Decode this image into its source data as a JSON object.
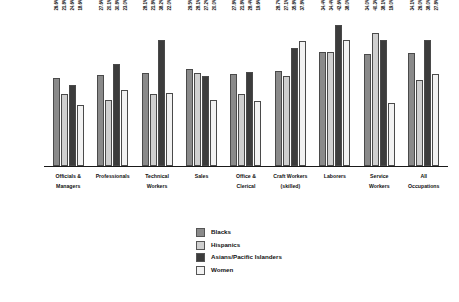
{
  "chart_data": {
    "type": "bar",
    "title": "",
    "xlabel": "",
    "ylabel": "",
    "ylim": [
      0,
      46
    ],
    "grid": false,
    "legend_position": "bottom-center",
    "value_label_format": "percent",
    "categories": [
      "Officials &\nManagers",
      "Professionals",
      "Technical\nWorkers",
      "Sales",
      "Office &\nClerical",
      "Craft Workers\n(skilled)",
      "Laborers",
      "Service\nWorkers",
      "All\nOccupations"
    ],
    "series": [
      {
        "name": "Blacks",
        "color": "#8a8a8a",
        "values": [
          26.6,
          27.6,
          28.1,
          29.5,
          27.8,
          28.7,
          34.4,
          34.0,
          34.1
        ],
        "labels": [
          "26.6%",
          "27.6%",
          "28.1%",
          "29.5%",
          "27.8%",
          "28.7%",
          "34.4%",
          "34.0%",
          "34.1%"
        ]
      },
      {
        "name": "Hispanics",
        "color": "#cfcfcf",
        "values": [
          21.8,
          20.1,
          21.8,
          28.1,
          21.8,
          27.1,
          34.4,
          40.3,
          26.0
        ],
        "labels": [
          "21.8%",
          "20.1%",
          "21.8%",
          "28.1%",
          "21.8%",
          "27.1%",
          "34.4%",
          "40.3%",
          "26.0%"
        ]
      },
      {
        "name": "Asians/Pacific Islanders",
        "color": "#3c3c3c",
        "values": [
          24.6,
          30.8,
          38.2,
          27.2,
          28.4,
          35.8,
          42.6,
          38.1,
          38.0
        ],
        "labels": [
          "24.6%",
          "30.8%",
          "38.2%",
          "27.2%",
          "28.4%",
          "35.8%",
          "42.6%",
          "38.1%",
          "38.0%"
        ]
      },
      {
        "name": "Women",
        "color": "#f2f2f2",
        "values": [
          18.6,
          23.0,
          22.0,
          20.0,
          19.6,
          37.8,
          38.0,
          19.0,
          27.8
        ],
        "labels": [
          "18.6%",
          "23.0%",
          "22.0%",
          "20.0%",
          "19.6%",
          "37.8%",
          "38.0%",
          "19.0%",
          "27.8%"
        ]
      }
    ]
  },
  "legend": {
    "items": [
      {
        "label": "Blacks"
      },
      {
        "label": "Hispanics"
      },
      {
        "label": "Asians/Pacific Islanders"
      },
      {
        "label": "Women"
      }
    ]
  }
}
